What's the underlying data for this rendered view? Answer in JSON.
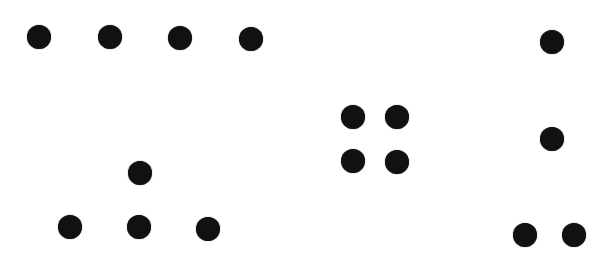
{
  "colors": {
    "background": "#ffffff",
    "dot": "#111111"
  },
  "dot_size": 24,
  "groups": [
    {
      "name": "row-of-four",
      "count": 4,
      "dots": [
        [
          39,
          37
        ],
        [
          110,
          37
        ],
        [
          180,
          38
        ],
        [
          251,
          39
        ]
      ]
    },
    {
      "name": "triangle-of-four",
      "count": 4,
      "dots": [
        [
          140,
          173
        ],
        [
          70,
          227
        ],
        [
          139,
          227
        ],
        [
          208,
          229
        ]
      ]
    },
    {
      "name": "square-of-four",
      "count": 4,
      "dots": [
        [
          353,
          117
        ],
        [
          397,
          117
        ],
        [
          353,
          161
        ],
        [
          397,
          162
        ]
      ]
    },
    {
      "name": "column-of-four",
      "count": 4,
      "dots": [
        [
          552,
          42
        ],
        [
          552,
          139
        ],
        [
          525,
          235
        ],
        [
          574,
          235
        ]
      ]
    }
  ]
}
